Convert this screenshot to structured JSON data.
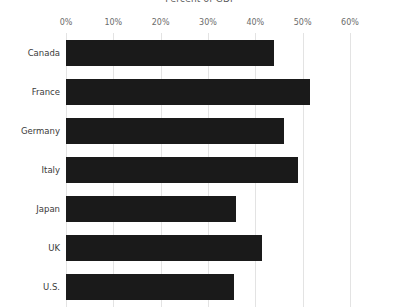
{
  "chart_data": {
    "type": "bar",
    "orientation": "horizontal",
    "title": "Percent of GDP",
    "xlabel": "",
    "ylabel": "",
    "categories": [
      "Canada",
      "France",
      "Germany",
      "Italy",
      "Japan",
      "UK",
      "U.S."
    ],
    "values": [
      44.0,
      51.5,
      46.0,
      49.0,
      36.0,
      41.5,
      35.5
    ],
    "xlim": [
      0,
      60
    ],
    "xticks": [
      0,
      10,
      20,
      30,
      40,
      50,
      60
    ],
    "xtick_labels": [
      "0%",
      "10%",
      "20%",
      "30%",
      "40%",
      "50%",
      "60%"
    ],
    "grid": true,
    "grid_axis": "x",
    "legend": false,
    "bar_color": "#1a1a1a",
    "grid_color": "#e3e3e3",
    "background_color": "#ffffff"
  }
}
